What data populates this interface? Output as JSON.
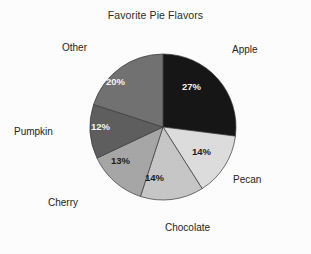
{
  "chart_data": {
    "type": "pie",
    "title": "Favorite Pie Flavors",
    "xlabel": "",
    "ylabel": "",
    "legend_position": "none",
    "grid": false,
    "start_angle_deg": 0,
    "direction": "clockwise",
    "categories": [
      "Apple",
      "Pecan",
      "Chocolate",
      "Cherry",
      "Pumpkin",
      "Other"
    ],
    "values": [
      27,
      14,
      14,
      13,
      12,
      20
    ],
    "value_unit": "%",
    "slices": [
      {
        "label": "Apple",
        "value": 27,
        "value_text": "27%",
        "color": "#161616",
        "text_color": "#f4f4f4"
      },
      {
        "label": "Pecan",
        "value": 14,
        "value_text": "14%",
        "color": "#dcdcdc",
        "text_color": "#1c1c1c"
      },
      {
        "label": "Chocolate",
        "value": 14,
        "value_text": "14%",
        "color": "#c6c6c6",
        "text_color": "#1c1c1c"
      },
      {
        "label": "Cherry",
        "value": 13,
        "value_text": "13%",
        "color": "#a6a6a6",
        "text_color": "#1c1c1c"
      },
      {
        "label": "Pumpkin",
        "value": 12,
        "value_text": "12%",
        "color": "#5e5e5e",
        "text_color": "#f4f4f4"
      },
      {
        "label": "Other",
        "value": 20,
        "value_text": "20%",
        "color": "#717171",
        "text_color": "#f4f4f4"
      }
    ]
  },
  "figure": {
    "title": "Favorite Pie Flavors",
    "background_color": "#fcfcfc",
    "outline_color": "#3a3a3a"
  }
}
